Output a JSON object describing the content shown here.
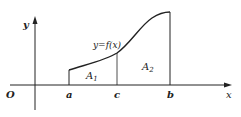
{
  "diagram": {
    "axes": {
      "x_label": "x",
      "y_label": "y",
      "origin_label": "O"
    },
    "points": {
      "a": "a",
      "c": "c",
      "b": "b"
    },
    "curve_label": "y=f(x)",
    "regions": [
      {
        "name": "A",
        "subscript": "1"
      },
      {
        "name": "A",
        "subscript": "2"
      }
    ],
    "colors": {
      "stroke": "#222222",
      "background": "#ffffff"
    }
  }
}
